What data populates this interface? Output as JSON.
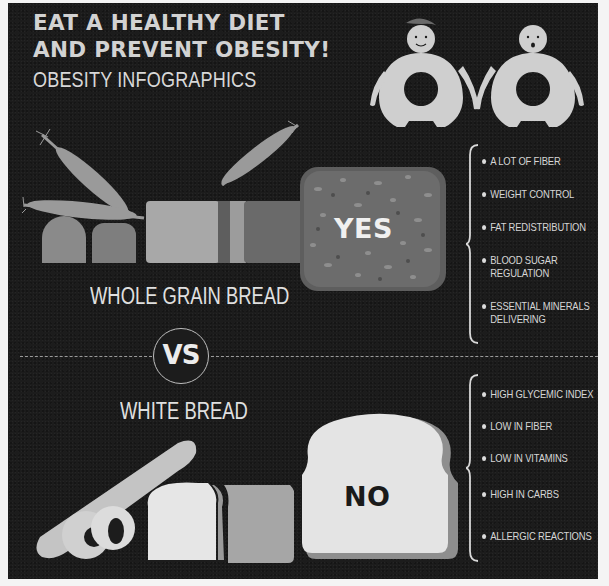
{
  "header": {
    "title_line1": "EAT A HEALTHY DIET",
    "title_line2": "AND PREVENT OBESITY!",
    "subtitle": "OBESITY INFOGRAPHICS"
  },
  "illustrations": {
    "top_right": "two-obese-figures-holding-hands",
    "whole_grain": "whole-grain-loaf-with-wheat-ears",
    "white": "baguette-bagels-white-loaf"
  },
  "whole_grain": {
    "label": "WHOLE GRAIN BREAD",
    "verdict": "YES",
    "benefits": [
      "A LOT OF FIBER",
      "WEIGHT CONTROL",
      "FAT REDISTRIBUTION",
      "BLOOD SUGAR REGULATION",
      "ESSENTIAL MINERALS DELIVERING"
    ],
    "benefits_lines": [
      [
        "A LOT OF FIBER"
      ],
      [
        "WEIGHT CONTROL"
      ],
      [
        "FAT REDISTRIBUTION"
      ],
      [
        "BLOOD SUGAR",
        "REGULATION"
      ],
      [
        "ESSENTIAL MINERALS",
        "DELIVERING"
      ]
    ]
  },
  "divider": {
    "vs_label": "VS"
  },
  "white_bread": {
    "label": "WHITE BREAD",
    "verdict": "NO",
    "drawbacks": [
      "HIGH GLYCEMIC INDEX",
      "LOW IN FIBER",
      "LOW IN VITAMINS",
      "HIGH IN CARBS",
      "ALLERGIC REACTIONS"
    ]
  },
  "colors": {
    "background": "#1c1c1c",
    "page": "#f4f4f4",
    "text_light": "#d6d6d6",
    "whole_grain_slice": "#6a6a6a",
    "white_slice": "#e8e8e8",
    "no_text": "#1a1a1a"
  }
}
